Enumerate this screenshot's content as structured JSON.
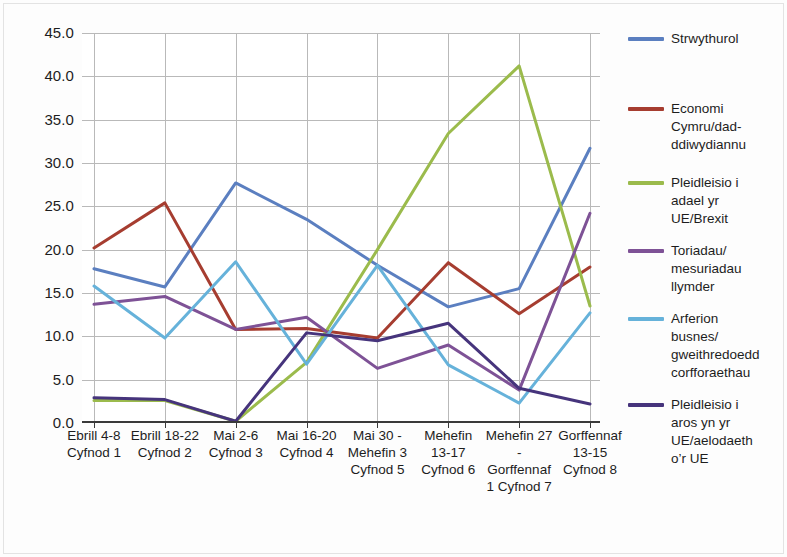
{
  "chart_data": {
    "type": "line",
    "title": "",
    "subtitle": "",
    "xlabel": "",
    "ylabel": "",
    "ylim": [
      0,
      45
    ],
    "ytick_step": 5,
    "yticks": [
      "45.0",
      "40.0",
      "35.0",
      "30.0",
      "25.0",
      "20.0",
      "15.0",
      "10.0",
      "5.0",
      "0.0"
    ],
    "grid": true,
    "legend_position": "right",
    "categories": [
      "Ebrill 4-8 Cyfnod 1",
      "Ebrill 18-22 Cyfnod 2",
      "Mai 2-6 Cyfnod 3",
      "Mai 16-20 Cyfnod 4",
      "Mai 30 - Mehefin 3 Cyfnod 5",
      "Mehefin 13-17 Cyfnod 6",
      "Mehefin 27 - Gorffennaf 1 Cyfnod 7",
      "Gorffennaf 13-15 Cyfnod 8"
    ],
    "category_lines": [
      [
        "Ebrill 4-8",
        "Cyfnod 1"
      ],
      [
        "Ebrill 18-22",
        "Cyfnod 2"
      ],
      [
        "Mai 2-6",
        "Cyfnod 3"
      ],
      [
        "Mai 16-20",
        "Cyfnod 4"
      ],
      [
        "Mai 30 -",
        "Mehefin 3",
        "Cyfnod 5"
      ],
      [
        "Mehefin",
        "13-17",
        "Cyfnod 6"
      ],
      [
        "Mehefin 27",
        "-",
        "Gorffennaf",
        "1 Cyfnod 7"
      ],
      [
        "Gorffennaf",
        "13-15",
        "Cyfnod 8"
      ]
    ],
    "series": [
      {
        "name": "Strwythurol",
        "color": "#5b7fc0",
        "label_lines": [
          "Strwythurol"
        ],
        "values": [
          17.8,
          15.7,
          27.7,
          23.5,
          18.2,
          13.4,
          15.5,
          31.7
        ]
      },
      {
        "name": "Economi Cymru/dad-ddiwydiannu",
        "color": "#a63d30",
        "label_lines": [
          "Economi",
          "Cymru/dad-",
          "ddiwydiannu"
        ],
        "values": [
          20.2,
          25.4,
          10.8,
          10.9,
          9.8,
          18.5,
          12.6,
          18.0
        ]
      },
      {
        "name": "Pleidleisio i adael yr UE/Brexit",
        "color": "#9bbb4c",
        "label_lines": [
          "Pleidleisio i",
          "adael yr",
          "UE/Brexit"
        ],
        "values": [
          2.6,
          2.6,
          0.2,
          7.0,
          20.0,
          33.4,
          41.2,
          13.5
        ]
      },
      {
        "name": "Toriadau/mesuriadau llymder",
        "color": "#7e5296",
        "label_lines": [
          "Toriadau/",
          "mesuriadau",
          "llymder"
        ],
        "values": [
          13.7,
          14.6,
          10.8,
          12.2,
          6.3,
          9.0,
          3.8,
          24.2
        ]
      },
      {
        "name": "Arferion busnes/gweithredoedd corfforaethau",
        "color": "#66b2da",
        "label_lines": [
          "Arferion",
          "busnes/",
          "gweithredoedd",
          "corfforaethau"
        ],
        "values": [
          15.8,
          9.8,
          18.6,
          6.8,
          18.2,
          6.7,
          2.3,
          12.7
        ]
      },
      {
        "name": "Pleidleisio i aros yn yr UE/aelodaeth o'r UE",
        "color": "#46347c",
        "label_lines": [
          "Pleidleisio i",
          "aros yn yr",
          "UE/aelodaeth",
          "o’r UE"
        ],
        "values": [
          2.9,
          2.7,
          0.2,
          10.4,
          9.5,
          11.5,
          4.0,
          2.2
        ]
      }
    ]
  }
}
